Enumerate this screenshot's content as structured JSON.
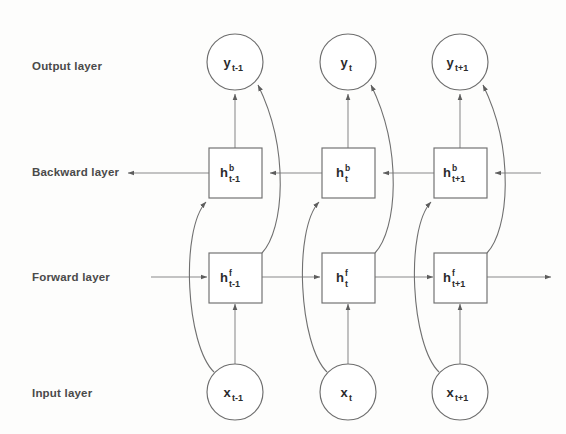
{
  "figure": {
    "background_color": "#fdfdfc",
    "line_color": "#7a7a7a",
    "text_color": "#2b2b2b",
    "label_color": "#4a4a4a"
  },
  "row_labels": [
    {
      "id": "output-layer",
      "text": "Output layer",
      "y": 66
    },
    {
      "id": "backward-layer",
      "text": "Backward layer",
      "y": 172
    },
    {
      "id": "forward-layer",
      "text": "Forward layer",
      "y": 277
    },
    {
      "id": "input-layer",
      "text": "Input layer",
      "y": 393
    }
  ],
  "columns": [
    {
      "id": "t-minus-1",
      "x": 235
    },
    {
      "id": "t",
      "x": 348
    },
    {
      "id": "t-plus-1",
      "x": 460
    }
  ],
  "nodes": {
    "output": [
      {
        "id": "y-t-minus-1",
        "base": "y",
        "sup": "",
        "sub": "t-1",
        "shape": "circle"
      },
      {
        "id": "y-t",
        "base": "y",
        "sup": "",
        "sub": "t",
        "shape": "circle"
      },
      {
        "id": "y-t-plus-1",
        "base": "y",
        "sup": "",
        "sub": "t+1",
        "shape": "circle"
      }
    ],
    "backward": [
      {
        "id": "h-b-t-minus-1",
        "base": "h",
        "sup": "b",
        "sub": "t-1",
        "shape": "rect"
      },
      {
        "id": "h-b-t",
        "base": "h",
        "sup": "b",
        "sub": "t",
        "shape": "rect"
      },
      {
        "id": "h-b-t-plus-1",
        "base": "h",
        "sup": "b",
        "sub": "t+1",
        "shape": "rect"
      }
    ],
    "forward": [
      {
        "id": "h-f-t-minus-1",
        "base": "h",
        "sup": "f",
        "sub": "t-1",
        "shape": "rect"
      },
      {
        "id": "h-f-t",
        "base": "h",
        "sup": "f",
        "sub": "t",
        "shape": "rect"
      },
      {
        "id": "h-f-t-plus-1",
        "base": "h",
        "sup": "f",
        "sub": "t+1",
        "shape": "rect"
      }
    ],
    "input": [
      {
        "id": "x-t-minus-1",
        "base": "x",
        "sup": "",
        "sub": "t-1",
        "shape": "circle"
      },
      {
        "id": "x-t",
        "base": "x",
        "sup": "",
        "sub": "t",
        "shape": "circle"
      },
      {
        "id": "x-t-plus-1",
        "base": "x",
        "sup": "",
        "sub": "t+1",
        "shape": "circle"
      }
    ]
  },
  "flow": {
    "backward_direction": "right-to-left",
    "forward_direction": "left-to-right",
    "vertical_edges": [
      "backward-to-output",
      "input-to-forward"
    ],
    "curved_edges": [
      "forward-to-output",
      "input-to-backward"
    ]
  }
}
